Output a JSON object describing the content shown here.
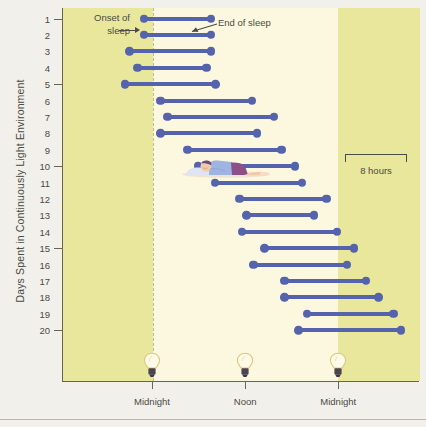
{
  "axes": {
    "y_title": "Days Spent in Continuously Light Environment",
    "y_labels": [
      "1",
      "2",
      "3",
      "4",
      "5",
      "6",
      "7",
      "8",
      "9",
      "10",
      "11",
      "12",
      "13",
      "14",
      "15",
      "16",
      "17",
      "18",
      "19",
      "20"
    ],
    "y_major_ticks": [
      "1",
      "5",
      "10",
      "15",
      "20"
    ],
    "x_labels": [
      "Midnight",
      "Noon",
      "Midnight"
    ]
  },
  "annotations": {
    "onset": "Onset of\nsleep",
    "onset_line1": "Onset of",
    "onset_line2": "sleep",
    "end": "End of sleep",
    "scalebar": "8 hours"
  },
  "icons": {
    "bulb": "light-bulb-icon",
    "sleeper": "sleeping-person-icon",
    "arrow_onset": "arrow-right-icon",
    "arrow_end": "arrow-pointer-icon"
  },
  "colors": {
    "bar": "#5463ab",
    "dark_band": "#e9e79c",
    "light_band": "#fbf8df",
    "axis": "#6b6550",
    "text": "#4a4a46",
    "page": "#f2f0ea"
  },
  "chart_data": {
    "type": "bar",
    "title": "",
    "subtitle": "",
    "xlabel": "",
    "ylabel": "Days Spent in Continuously Light Environment",
    "grid": false,
    "legend_position": "none",
    "orientation": "horizontal-range",
    "x_unit": "clock hour (hours from first Midnight)",
    "xlim": [
      -11.6,
      34.4
    ],
    "ylim": [
      1,
      20
    ],
    "x_tick_values": [
      0,
      12,
      24
    ],
    "x_tick_labels": [
      "Midnight",
      "Noon",
      "Midnight"
    ],
    "scalebar_hours": 8,
    "categories": [
      "1",
      "2",
      "3",
      "4",
      "5",
      "6",
      "7",
      "8",
      "9",
      "10",
      "11",
      "12",
      "13",
      "14",
      "15",
      "16",
      "17",
      "18",
      "19",
      "20"
    ],
    "series": [
      {
        "name": "Sleep episode",
        "type": "range",
        "values": [
          {
            "day": 1,
            "start": -1.1,
            "end": 7.7,
            "duration": 8.8
          },
          {
            "day": 2,
            "start": -1.1,
            "end": 7.7,
            "duration": 8.8
          },
          {
            "day": 3,
            "start": -3.0,
            "end": 7.7,
            "duration": 10.7
          },
          {
            "day": 4,
            "start": -2.0,
            "end": 7.1,
            "duration": 9.1
          },
          {
            "day": 5,
            "start": -3.6,
            "end": 8.3,
            "duration": 11.9
          },
          {
            "day": 6,
            "start": 1.0,
            "end": 13.0,
            "duration": 12.0
          },
          {
            "day": 7,
            "start": 1.9,
            "end": 15.8,
            "duration": 13.9
          },
          {
            "day": 8,
            "start": 1.0,
            "end": 13.6,
            "duration": 12.6
          },
          {
            "day": 9,
            "start": 4.5,
            "end": 16.8,
            "duration": 12.3
          },
          {
            "day": 10,
            "start": 5.8,
            "end": 18.5,
            "duration": 12.7
          },
          {
            "day": 11,
            "start": 8.0,
            "end": 19.4,
            "duration": 11.4
          },
          {
            "day": 12,
            "start": 11.2,
            "end": 22.6,
            "duration": 11.4
          },
          {
            "day": 13,
            "start": 12.1,
            "end": 21.0,
            "duration": 8.9
          },
          {
            "day": 14,
            "start": 11.5,
            "end": 23.9,
            "duration": 12.4
          },
          {
            "day": 15,
            "start": 14.4,
            "end": 26.1,
            "duration": 11.7
          },
          {
            "day": 16,
            "start": 13.0,
            "end": 25.2,
            "duration": 12.2
          },
          {
            "day": 17,
            "start": 17.0,
            "end": 27.7,
            "duration": 10.7
          },
          {
            "day": 18,
            "start": 17.0,
            "end": 29.3,
            "duration": 12.3
          },
          {
            "day": 19,
            "start": 19.9,
            "end": 31.2,
            "duration": 11.3
          },
          {
            "day": 20,
            "start": 18.8,
            "end": 32.2,
            "duration": 13.4
          }
        ]
      }
    ],
    "shaded_regions": [
      {
        "label": "dark",
        "from": -11.6,
        "to": 0.0
      },
      {
        "label": "dark",
        "from": 24.0,
        "to": 34.4
      }
    ]
  }
}
